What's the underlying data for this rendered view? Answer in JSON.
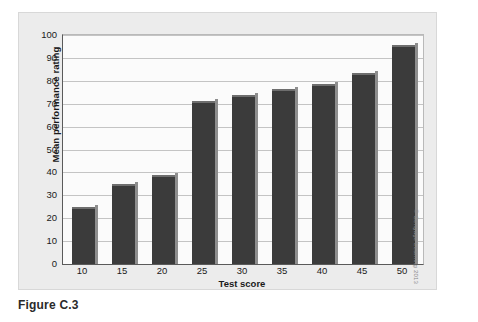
{
  "caption": "Figure C.3",
  "copyright": "© Cengage Learning 2013",
  "colors": {
    "bar_fill": "#3b3b3b",
    "bar_highlight": "#8e8e8e",
    "panel_bg": "#ececec",
    "plot_bg": "#fbfbfb",
    "gridline": "#c4c4c4",
    "axis_line": "#5a5a5a",
    "text": "#1a1a1a"
  },
  "chart_data": {
    "type": "bar",
    "title": "",
    "subtitle": "",
    "xlabel": "Test score",
    "ylabel": "Mean performance rating",
    "categories": [
      "10",
      "15",
      "20",
      "25",
      "30",
      "35",
      "40",
      "45",
      "50"
    ],
    "values": [
      25,
      35,
      39,
      71,
      74,
      76.5,
      78.5,
      83.5,
      95.5
    ],
    "ylim": [
      0,
      100
    ],
    "y_ticks": [
      "0",
      "10",
      "20",
      "30",
      "40",
      "50",
      "60",
      "70",
      "80",
      "90",
      "100"
    ],
    "y_tick_values": [
      0,
      10,
      20,
      30,
      40,
      50,
      60,
      70,
      80,
      90,
      100
    ],
    "grid": true,
    "grid_axis": "y",
    "legend": false,
    "legend_position": "none",
    "series": [
      {
        "name": "Mean performance rating",
        "values": [
          25,
          35,
          39,
          71,
          74,
          76.5,
          78.5,
          83.5,
          95.5
        ]
      }
    ]
  }
}
